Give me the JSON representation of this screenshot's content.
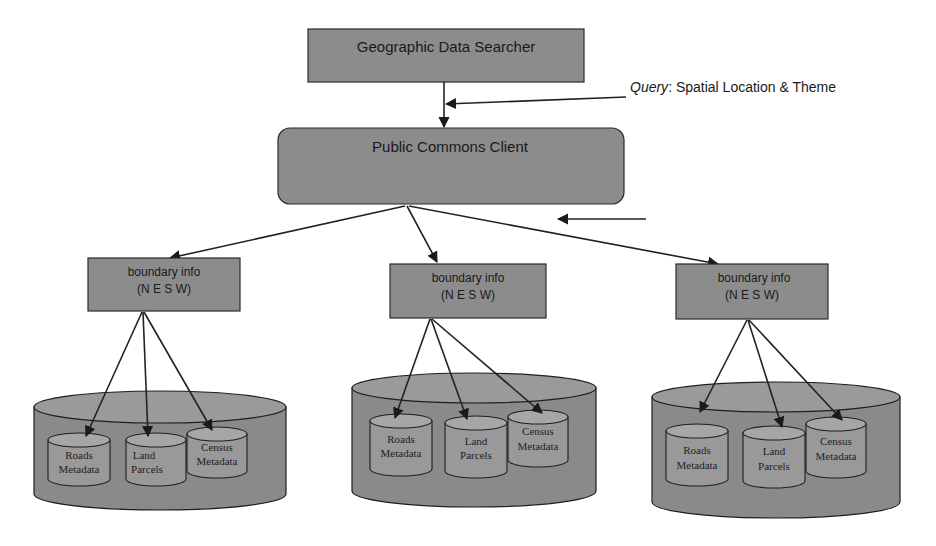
{
  "diagram": {
    "top_node": {
      "label": "Geographic Data Searcher"
    },
    "query": {
      "prefix": "Query",
      "text": ": Spatial Location & Theme"
    },
    "client_node": {
      "label": "Public Commons Client"
    },
    "repositories": [
      {
        "boundary_label_1": "boundary info",
        "boundary_label_2": "(N E S W)",
        "databases": [
          {
            "line1": "Roads",
            "line2": "Metadata"
          },
          {
            "line1": "Land",
            "line2": "Parcels"
          },
          {
            "line1": "Census",
            "line2": "Metadata"
          }
        ]
      },
      {
        "boundary_label_1": "boundary info",
        "boundary_label_2": "(N E S W)",
        "databases": [
          {
            "line1": "Roads",
            "line2": "Metadata"
          },
          {
            "line1": "Land",
            "line2": "Parcels"
          },
          {
            "line1": "Census",
            "line2": "Metadata"
          }
        ]
      },
      {
        "boundary_label_1": "boundary info",
        "boundary_label_2": "(N E S W)",
        "databases": [
          {
            "line1": "Roads",
            "line2": "Metadata"
          },
          {
            "line1": "Land",
            "line2": "Parcels"
          },
          {
            "line1": "Census",
            "line2": "Metadata"
          }
        ]
      }
    ]
  },
  "colors": {
    "node_fill": "#8c8c8c",
    "cylinder_fill": "#8a8a8a",
    "line": "#222222",
    "background": "#ffffff"
  }
}
